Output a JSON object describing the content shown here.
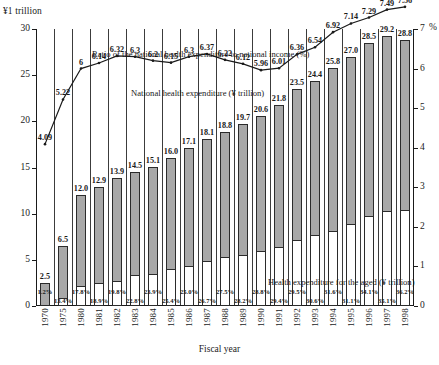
{
  "chart_data": {
    "type": "bar",
    "title": "",
    "xlabel": "Fiscal year",
    "ylabel_left": "¥1 trillion",
    "ylabel_right": "%",
    "ylim_left": [
      0,
      30
    ],
    "ylim_right": [
      0,
      7
    ],
    "yticks_left": [
      "0",
      "5",
      "10",
      "15",
      "20",
      "25",
      "30"
    ],
    "yticks_right": [
      "0",
      "1",
      "2",
      "3",
      "4",
      "5",
      "6",
      "7"
    ],
    "grid": false,
    "legend_position": "inline-annotations",
    "categories": [
      "1970",
      "1975",
      "1980",
      "1981",
      "1982",
      "1983",
      "1984",
      "1985",
      "1986",
      "1987",
      "1988",
      "1989",
      "1990",
      "1991",
      "1992",
      "1993",
      "1994",
      "1995",
      "1996",
      "1997",
      "1998"
    ],
    "series": [
      {
        "name": "National health expenditure (¥ trillion)",
        "type": "bar",
        "axis": "left",
        "values": [
          2.5,
          6.5,
          12.0,
          12.9,
          13.9,
          14.5,
          15.1,
          16.0,
          17.1,
          18.1,
          18.8,
          19.7,
          20.6,
          21.8,
          23.5,
          24.4,
          25.8,
          27.0,
          28.5,
          29.2,
          28.8
        ]
      },
      {
        "name": "Health expenditure for the aged (¥ trillion)",
        "type": "bar-inner",
        "axis": "left",
        "values": [
          0.0,
          0.87,
          2.14,
          2.44,
          2.75,
          3.33,
          3.48,
          4.06,
          4.36,
          4.84,
          5.3,
          5.56,
          5.93,
          6.41,
          7.1,
          7.71,
          8.15,
          8.91,
          9.72,
          10.25,
          10.43
        ],
        "pct_labels": [
          "1.2%",
          "13.4%",
          "17.8%",
          "18.9%",
          "19.8%",
          "22.8%",
          "23.9%",
          "25.4%",
          "25.0%",
          "26.7%",
          "27.5%",
          "28.2%",
          "28.8%",
          "29.4%",
          "29.5%",
          "30.6%",
          "31.6%",
          "31.1%",
          "34.1%",
          "35.1%",
          "36.2%"
        ]
      },
      {
        "name": "Ratio of the national health expenditure to national income (%)",
        "type": "line",
        "axis": "right",
        "values": [
          4.09,
          5.22,
          6.0,
          6.14,
          6.32,
          6.3,
          6.2,
          6.15,
          6.3,
          6.37,
          6.22,
          6.12,
          5.96,
          6.01,
          6.36,
          6.54,
          6.92,
          7.14,
          7.29,
          7.49,
          7.56
        ]
      }
    ],
    "annotations": [
      {
        "id": "ratio",
        "text": "Ratio of the national health expenditure to national income (%)"
      },
      {
        "id": "nhe",
        "text": "National health expenditure (¥ trillion)"
      },
      {
        "id": "aged",
        "text": "Health expenditure for the aged (¥ trillion)"
      }
    ]
  },
  "colors": {
    "bar_total": "#a8a8a8",
    "bar_aged": "#ffffff",
    "outline": "#2b2b2b",
    "line": "#1a1a1a",
    "background": "#ffffff"
  }
}
